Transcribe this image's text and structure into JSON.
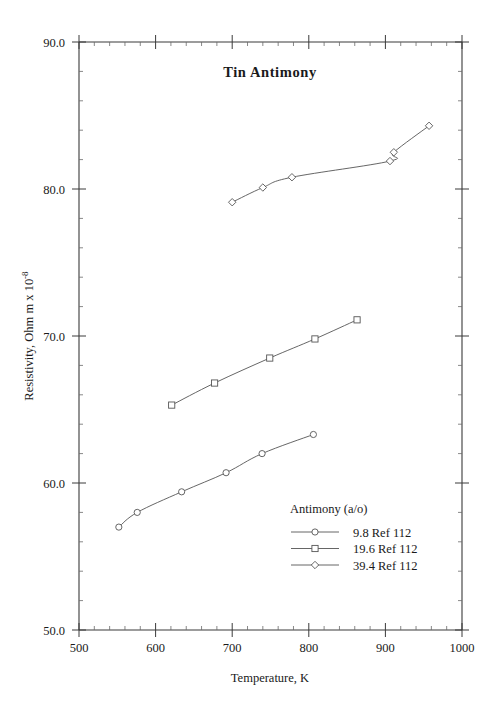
{
  "chart_data": {
    "type": "line",
    "title": "Tin  Antimony",
    "xlabel": "Temperature,  K",
    "ylabel": "Resistivity, Ohm m x 10",
    "ylabel_exponent": "-8",
    "xlim": [
      500,
      1000
    ],
    "ylim": [
      50.0,
      90.0
    ],
    "xticks": [
      500,
      600,
      700,
      800,
      900,
      1000
    ],
    "xtick_labels": [
      "500",
      "600",
      "700",
      "800",
      "900",
      "1000"
    ],
    "yticks": [
      50.0,
      60.0,
      70.0,
      80.0,
      90.0
    ],
    "ytick_labels": [
      "50.0",
      "60.0",
      "70.0",
      "80.0",
      "90.0"
    ],
    "x_minor_step": 20,
    "y_minor_step": 2,
    "grid": false,
    "legend_position": "lower-right-inside",
    "legend_title": "Antimony (a/o)",
    "series": [
      {
        "name": "9.8 Ref 112",
        "composition": "9.8",
        "reference": "Ref 112",
        "marker": "circle",
        "points": [
          {
            "x": 552,
            "y": 57.0
          },
          {
            "x": 576,
            "y": 58.0
          },
          {
            "x": 634,
            "y": 59.4
          },
          {
            "x": 692,
            "y": 60.7
          },
          {
            "x": 739,
            "y": 62.0
          },
          {
            "x": 806,
            "y": 63.3
          }
        ]
      },
      {
        "name": "19.6 Ref 112",
        "composition": "19.6",
        "reference": "Ref 112",
        "marker": "square",
        "points": [
          {
            "x": 621,
            "y": 65.3
          },
          {
            "x": 677,
            "y": 66.8
          },
          {
            "x": 749,
            "y": 68.5
          },
          {
            "x": 808,
            "y": 69.8
          },
          {
            "x": 863,
            "y": 71.1
          }
        ]
      },
      {
        "name": "39.4 Ref 112",
        "composition": "39.4",
        "reference": "Ref 112",
        "marker": "diamond",
        "points": [
          {
            "x": 700,
            "y": 79.1
          },
          {
            "x": 740,
            "y": 80.1
          },
          {
            "x": 778,
            "y": 80.8
          },
          {
            "x": 906,
            "y": 81.9
          },
          {
            "x": 911,
            "y": 82.5
          },
          {
            "x": 957,
            "y": 84.3
          }
        ]
      }
    ]
  },
  "legend": {
    "title": "Antimony (a/o)",
    "entries": [
      {
        "label": "9.8 Ref 112",
        "marker": "circle"
      },
      {
        "label": "19.6 Ref 112",
        "marker": "square"
      },
      {
        "label": "39.4 Ref 112",
        "marker": "diamond"
      }
    ]
  },
  "colors": {
    "axis": "#3a3a3a",
    "line": "#555555",
    "text": "#1a1a1a",
    "background": "#ffffff"
  }
}
